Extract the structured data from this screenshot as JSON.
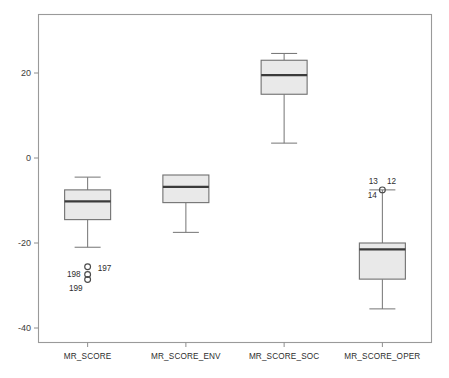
{
  "chart_data": {
    "type": "box",
    "title": "",
    "xlabel": "",
    "ylabel": "",
    "ylim": [
      -47,
      33
    ],
    "grid": false,
    "legend": "none",
    "yticks": [
      20,
      0,
      -20,
      -40
    ],
    "ytick_labels": [
      "20",
      "0",
      "-20",
      "-40"
    ],
    "categories": [
      "MR_SCORE",
      "MR_SCORE_ENV",
      "MR_SCORE_SOC",
      "MR_SCORE_OPER"
    ],
    "boxes": [
      {
        "category": "MR_SCORE",
        "whisker_low": -21.0,
        "q1": -14.5,
        "median": -10.2,
        "q3": -7.5,
        "whisker_high": -4.5,
        "outliers": [
          {
            "value": -25.6,
            "label": "197"
          },
          {
            "value": -27.4,
            "label": "198"
          },
          {
            "value": -28.6,
            "label": "199"
          }
        ]
      },
      {
        "category": "MR_SCORE_ENV",
        "whisker_low": -17.5,
        "q1": -10.5,
        "median": -6.8,
        "q3": -4.0,
        "whisker_high": -4.0,
        "outliers": []
      },
      {
        "category": "MR_SCORE_SOC",
        "whisker_low": 3.5,
        "q1": 15.0,
        "median": 19.5,
        "q3": 23.0,
        "whisker_high": 24.6,
        "outliers": []
      },
      {
        "category": "MR_SCORE_OPER",
        "whisker_low": -35.5,
        "q1": -28.5,
        "median": -21.5,
        "q3": -20.0,
        "whisker_high": -7.5,
        "outliers": [
          {
            "value": -7.5,
            "label": "12"
          },
          {
            "value": -7.5,
            "label": "13"
          },
          {
            "value": -7.5,
            "label": "14"
          }
        ]
      }
    ],
    "colors": {
      "box_fill": "#e9e9e9",
      "box_stroke": "#707070",
      "median_stroke": "#3a3a3a",
      "whisker_stroke": "#7a7a7a",
      "frame_stroke": "#9a9a9a",
      "text": "#2e2e2e",
      "background": "#ffffff"
    }
  }
}
